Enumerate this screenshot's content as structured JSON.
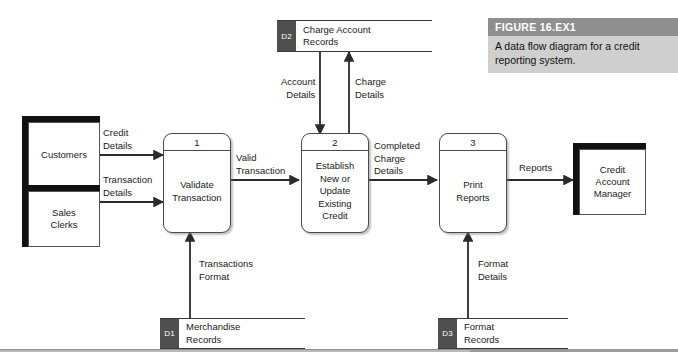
{
  "figure": {
    "title": "FIGURE 16.EX1",
    "description": "A data flow diagram for a credit reporting system.",
    "title_bg": "#8f8f8f",
    "body_bg": "#cfcfcf"
  },
  "entities": [
    {
      "name": "Customers",
      "label": "Customers"
    },
    {
      "name": "Sales Clerks",
      "label": "Sales\nClerks"
    },
    {
      "name": "Credit Account Manager",
      "label": "Credit\nAccount\nManager"
    }
  ],
  "entity_text": {
    "customers": "Customers",
    "sales_clerks_line1": "Sales",
    "sales_clerks_line2": "Clerks",
    "manager_line1": "Credit",
    "manager_line2": "Account",
    "manager_line3": "Manager"
  },
  "processes": [
    {
      "number": "1",
      "label": "Validate Transaction"
    },
    {
      "number": "2",
      "label": "Establish New or Update Existing Credit"
    },
    {
      "number": "3",
      "label": "Print Reports"
    }
  ],
  "process_text": {
    "p1_num": "1",
    "p1_l1": "Validate",
    "p1_l2": "Transaction",
    "p2_num": "2",
    "p2_l1": "Establish",
    "p2_l2": "New or",
    "p2_l3": "Update",
    "p2_l4": "Existing",
    "p2_l5": "Credit",
    "p3_num": "3",
    "p3_l1": "Print",
    "p3_l2": "Reports"
  },
  "stores": [
    {
      "id": "D1",
      "name": "Merchandise Records"
    },
    {
      "id": "D2",
      "name": "Charge Account Records"
    },
    {
      "id": "D3",
      "name": "Format Records"
    }
  ],
  "store_text": {
    "d1_id": "D1",
    "d1_l1": "Merchandise",
    "d1_l2": "Records",
    "d2_id": "D2",
    "d2_l1": "Charge Account",
    "d2_l2": "Records",
    "d3_id": "D3",
    "d3_l1": "Format",
    "d3_l2": "Records"
  },
  "flows": {
    "credit_details_l1": "Credit",
    "credit_details_l2": "Details",
    "transaction_details_l1": "Transaction",
    "transaction_details_l2": "Details",
    "valid_transaction_l1": "Valid",
    "valid_transaction_l2": "Transaction",
    "completed_charge_details_l1": "Completed",
    "completed_charge_details_l2": "Charge",
    "completed_charge_details_l3": "Details",
    "reports": "Reports",
    "account_details_l1": "Account",
    "account_details_l2": "Details",
    "charge_details_l1": "Charge",
    "charge_details_l2": "Details",
    "transactions_format_l1": "Transactions",
    "transactions_format_l2": "Format",
    "format_details_l1": "Format",
    "format_details_l2": "Details"
  },
  "colors": {
    "line": "#2b2b2b",
    "store_id_bg": "#4f4f4f",
    "entity_shadow": "#111111",
    "process_border": "#4a4a4a"
  }
}
